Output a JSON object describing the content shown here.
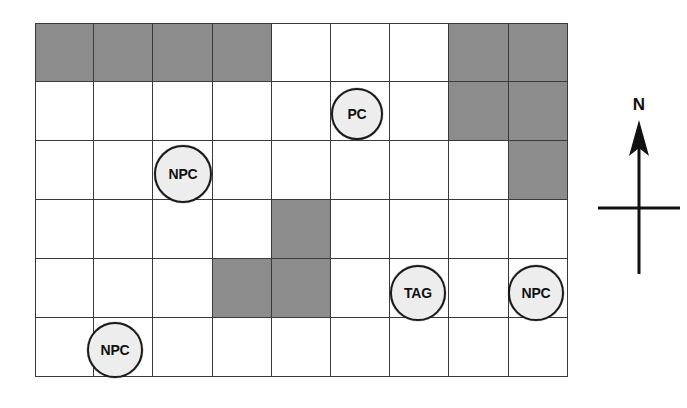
{
  "figure": {
    "name": "tactical-grid-map",
    "background_color": "#ffffff"
  },
  "grid": {
    "columns": 9,
    "rows": 6,
    "cell_width": 59.2,
    "cell_height": 59,
    "origin_x": 35,
    "origin_y": 23,
    "line_color": "#3a3a3a",
    "empty_cell_color": "#ffffff",
    "shaded_cell_color": "#8c8c8c",
    "shaded_cells": [
      {
        "row": 1,
        "col": 1
      },
      {
        "row": 1,
        "col": 2
      },
      {
        "row": 1,
        "col": 3
      },
      {
        "row": 1,
        "col": 4
      },
      {
        "row": 1,
        "col": 8
      },
      {
        "row": 1,
        "col": 9
      },
      {
        "row": 2,
        "col": 8
      },
      {
        "row": 2,
        "col": 9
      },
      {
        "row": 3,
        "col": 9
      },
      {
        "row": 4,
        "col": 5
      },
      {
        "row": 5,
        "col": 4
      },
      {
        "row": 5,
        "col": 5
      }
    ]
  },
  "tokens": [
    {
      "label": "PC",
      "name": "token-pc",
      "row": 2,
      "col": 6,
      "x": 331,
      "y": 88,
      "diameter": 52,
      "size_class": "token-size-sm",
      "fill": "#ededed",
      "stroke": "#1a1a1a"
    },
    {
      "label": "NPC",
      "name": "token-npc-west",
      "row": 3,
      "col": 3,
      "x": 154,
      "y": 145,
      "diameter": 58,
      "size_class": "token-size-md",
      "fill": "#ededed",
      "stroke": "#1a1a1a"
    },
    {
      "label": "TAG",
      "name": "token-tag",
      "row": 5,
      "col": 7,
      "x": 390,
      "y": 265,
      "diameter": 56,
      "size_class": "token-size-md",
      "fill": "#ededed",
      "stroke": "#1a1a1a"
    },
    {
      "label": "NPC",
      "name": "token-npc-east",
      "row": 5,
      "col": 9,
      "x": 508,
      "y": 265,
      "diameter": 56,
      "size_class": "token-size-md",
      "fill": "#ededed",
      "stroke": "#1a1a1a"
    },
    {
      "label": "NPC",
      "name": "token-npc-southwest",
      "row": 6,
      "col": 2,
      "x": 87,
      "y": 322,
      "diameter": 56,
      "size_class": "token-size-md",
      "fill": "#ededed",
      "stroke": "#1a1a1a"
    }
  ],
  "compass": {
    "north_label": "N",
    "color": "#111111"
  }
}
